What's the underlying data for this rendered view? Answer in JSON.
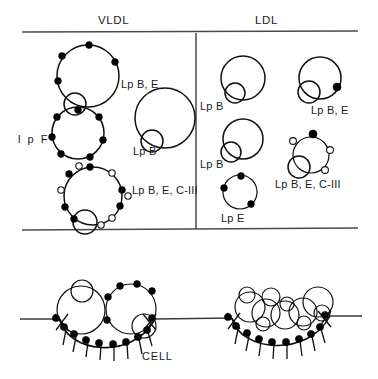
{
  "figure": {
    "title_absent": true,
    "panels": {
      "vldl": {
        "header": "VLDL",
        "particles": [
          {
            "name": "vldl-lp-b-e",
            "label": "Lp B, E",
            "filled_dots": 4,
            "open_dots": 0,
            "has_inner_circle": true,
            "size": "large"
          },
          {
            "name": "vldl-lp-f",
            "label": "l p F",
            "filled_dots": 7,
            "open_dots": 0,
            "has_inner_circle": false,
            "size": "medium"
          },
          {
            "name": "vldl-lp-b",
            "label": "Lp B",
            "filled_dots": 0,
            "open_dots": 0,
            "has_inner_circle": true,
            "size": "large"
          },
          {
            "name": "vldl-lp-b-e-ciii",
            "label": "Lp B, E, C-III",
            "filled_dots": 7,
            "open_dots": 6,
            "has_inner_circle": true,
            "size": "large"
          }
        ]
      },
      "ldl": {
        "header": "LDL",
        "particles": [
          {
            "name": "ldl-lp-b-1",
            "label": "Lp B",
            "filled_dots": 0,
            "open_dots": 0,
            "has_inner_circle": true,
            "size": "medium"
          },
          {
            "name": "ldl-lp-b-2",
            "label": "Lp B",
            "filled_dots": 0,
            "open_dots": 0,
            "has_inner_circle": true,
            "size": "medium"
          },
          {
            "name": "ldl-lp-e",
            "label": "Lp E",
            "filled_dots": 3,
            "open_dots": 0,
            "has_inner_circle": false,
            "size": "small"
          },
          {
            "name": "ldl-lp-b-e",
            "label": "Lp B, E",
            "filled_dots": 1,
            "open_dots": 0,
            "has_inner_circle": true,
            "size": "medium"
          },
          {
            "name": "ldl-lp-b-e-ciii",
            "label": "Lp B, E, C-III",
            "filled_dots": 1,
            "open_dots": 3,
            "has_inner_circle": true,
            "size": "medium"
          }
        ]
      }
    },
    "cell": {
      "label": "CELL",
      "pits": [
        {
          "name": "coated-pit-left",
          "bound_particles": 2,
          "receptors": 11,
          "side": "left"
        },
        {
          "name": "coated-pit-right",
          "bound_particles": 6,
          "receptors": 11,
          "side": "right"
        }
      ]
    },
    "colors": {
      "ink": "#111111",
      "rule": "#4a4a4a",
      "background": "#ffffff"
    }
  }
}
